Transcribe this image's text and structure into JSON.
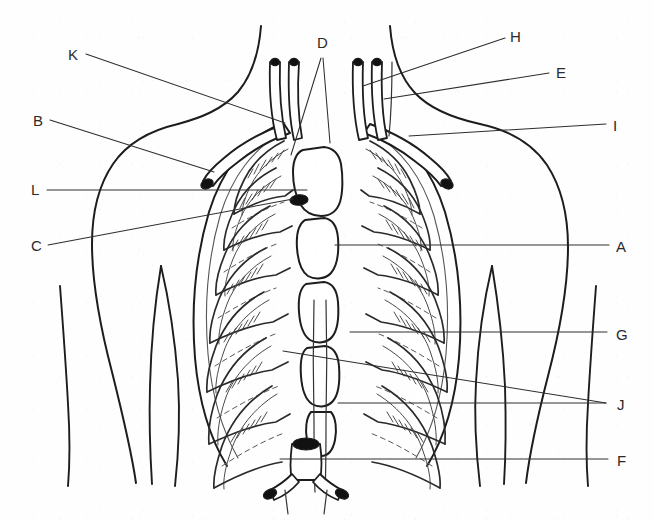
{
  "figure": {
    "width": 653,
    "height": 520,
    "background_color": "#fefefe",
    "ink_color": "#1d1d1d",
    "label_color": "#2b2b2b"
  },
  "labels": [
    {
      "id": "K",
      "text": "K",
      "x": 68,
      "y": 60,
      "side": "left"
    },
    {
      "id": "B",
      "text": "B",
      "x": 33,
      "y": 126,
      "side": "left"
    },
    {
      "id": "L",
      "text": "L",
      "x": 31,
      "y": 195,
      "side": "left"
    },
    {
      "id": "C",
      "text": "C",
      "x": 31,
      "y": 251,
      "side": "left"
    },
    {
      "id": "D",
      "text": "D",
      "x": 317,
      "y": 48,
      "side": "top"
    },
    {
      "id": "H",
      "text": "H",
      "x": 510,
      "y": 42,
      "side": "right"
    },
    {
      "id": "E",
      "text": "E",
      "x": 556,
      "y": 78,
      "side": "right"
    },
    {
      "id": "I",
      "text": "I",
      "x": 613,
      "y": 131,
      "side": "right"
    },
    {
      "id": "A",
      "text": "A",
      "x": 616,
      "y": 252,
      "side": "right"
    },
    {
      "id": "G",
      "text": "G",
      "x": 616,
      "y": 340,
      "side": "right"
    },
    {
      "id": "J",
      "text": "J",
      "x": 617,
      "y": 410,
      "side": "right"
    },
    {
      "id": "F",
      "text": "F",
      "x": 617,
      "y": 466,
      "side": "right"
    }
  ],
  "leaders": [
    {
      "for": "K",
      "path": "M 86 54 L 285 123"
    },
    {
      "for": "B",
      "path": "M 50 120 L 214 172"
    },
    {
      "for": "L",
      "path": "M 47 190 L 307 190"
    },
    {
      "for": "C",
      "path": "M 48 245 L 293 199"
    },
    {
      "for": "D1",
      "path": "M 321 58 L 291 155"
    },
    {
      "for": "D2",
      "path": "M 323 58 L 330 143"
    },
    {
      "for": "H",
      "path": "M 505 38 L 363 86"
    },
    {
      "for": "E",
      "path": "M 549 73 L 384 99"
    },
    {
      "for": "I",
      "path": "M 606 124 L 409 136"
    },
    {
      "for": "A",
      "path": "M 609 245 L 335 245"
    },
    {
      "for": "G",
      "path": "M 607 332 L 350 332"
    },
    {
      "for": "J1",
      "path": "M 606 403 L 283 351"
    },
    {
      "for": "J2",
      "path": "M 606 403 L 338 403"
    },
    {
      "for": "F",
      "path": "M 608 459 L 280 459"
    }
  ],
  "anatomy": {
    "regions": [
      {
        "name": "neck-and-shoulders",
        "description": "Outline of neck sloping into both shoulders and upper arms"
      },
      {
        "name": "left-clavicle",
        "description": "Clavicle crossing upper thorax on viewer left, dark oval acromial end"
      },
      {
        "name": "right-clavicle",
        "description": "Clavicle crossing upper thorax on viewer right, dark oval acromial end"
      },
      {
        "name": "sternum",
        "description": "Manubrium, body of sternum and xiphoid process in the midline"
      },
      {
        "name": "rib-cage-left",
        "description": "Seven pairs of anterior ribs with costal cartilage on viewer left"
      },
      {
        "name": "rib-cage-right",
        "description": "Seven pairs of anterior ribs with costal cartilage on viewer right"
      },
      {
        "name": "trachea",
        "description": "Midline airway descending from neck"
      },
      {
        "name": "carotid-vessels",
        "description": "Paired great vessels rising into the neck"
      },
      {
        "name": "bronchi",
        "description": "Bifurcating tubular structure low in the midline"
      },
      {
        "name": "costal-margin",
        "description": "Lower border of rib cage flaring to each side"
      }
    ]
  }
}
